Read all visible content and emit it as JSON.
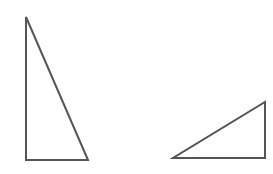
{
  "diagram": {
    "stroke_color": "#555555",
    "fill_color": "#ffffff",
    "stroke_width": 2,
    "shapes": [
      {
        "name": "tall-right-triangle",
        "type": "triangle",
        "points": [
          [
            26,
            17
          ],
          [
            26,
            160
          ],
          [
            88,
            160
          ]
        ],
        "right_angle_at": [
          26,
          160
        ]
      },
      {
        "name": "wide-right-triangle",
        "type": "triangle",
        "points": [
          [
            173,
            158
          ],
          [
            265,
            158
          ],
          [
            265,
            102
          ]
        ],
        "right_angle_at": [
          265,
          158
        ]
      }
    ]
  }
}
